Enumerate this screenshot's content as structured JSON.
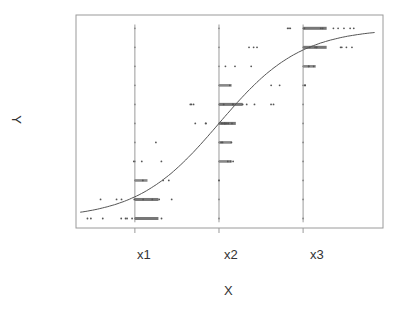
{
  "chart_data": {
    "type": "scatter",
    "title": "",
    "xlabel": "X",
    "ylabel": "Y",
    "x_tick_labels": [
      "x1",
      "x2",
      "x3"
    ],
    "x_tick_positions": [
      1,
      2,
      3
    ],
    "y_levels": [
      0,
      1,
      2,
      3,
      4,
      5,
      6,
      7,
      8,
      9,
      10
    ],
    "xlim": [
      0.3,
      3.95
    ],
    "ylim": [
      -0.5,
      10.7
    ],
    "grid": false,
    "legend": null,
    "vertical_reference_lines_at": [
      1,
      2,
      3
    ],
    "fitted_curve": {
      "shape": "logistic",
      "points": [
        [
          0.35,
          0.1
        ],
        [
          0.6,
          0.35
        ],
        [
          0.9,
          0.8
        ],
        [
          1.2,
          1.7
        ],
        [
          1.5,
          3.0
        ],
        [
          1.8,
          4.3
        ],
        [
          2.0,
          5.0
        ],
        [
          2.2,
          5.9
        ],
        [
          2.5,
          7.2
        ],
        [
          2.8,
          8.3
        ],
        [
          3.0,
          8.9
        ],
        [
          3.3,
          9.4
        ],
        [
          3.6,
          9.7
        ],
        [
          3.85,
          9.85
        ]
      ]
    },
    "series": [
      {
        "name": "observations",
        "clusters": [
          {
            "x": 1,
            "y": 0,
            "count": "many",
            "spread": [
              0.35,
              1.45
            ]
          },
          {
            "x": 1,
            "y": 1,
            "count": "many",
            "spread": [
              0.5,
              1.7
            ]
          },
          {
            "x": 1,
            "y": 2,
            "count": "several",
            "spread": [
              1.0,
              1.6
            ]
          },
          {
            "x": 1,
            "y": 3,
            "count": "few",
            "spread": [
              0.95,
              1.7
            ]
          },
          {
            "x": 1,
            "y": 4,
            "count": "few",
            "spread": [
              1.25,
              1.25
            ]
          },
          {
            "x": 1,
            "y": 5,
            "count": "few",
            "spread": [
              1.7,
              1.85
            ]
          },
          {
            "x": 1,
            "y": 6,
            "count": "few",
            "spread": [
              1.65,
              1.7
            ]
          },
          {
            "x": 2,
            "y": 2,
            "count": "few",
            "spread": [
              2.0,
              2.0
            ]
          },
          {
            "x": 2,
            "y": 3,
            "count": "several",
            "spread": [
              2.0,
              2.25
            ]
          },
          {
            "x": 2,
            "y": 4,
            "count": "several",
            "spread": [
              2.0,
              2.15
            ]
          },
          {
            "x": 2,
            "y": 5,
            "count": "many",
            "spread": [
              2.0,
              2.2
            ]
          },
          {
            "x": 2,
            "y": 6,
            "count": "many",
            "spread": [
              2.0,
              2.7
            ]
          },
          {
            "x": 2,
            "y": 7,
            "count": "several",
            "spread": [
              2.0,
              2.95
            ]
          },
          {
            "x": 2,
            "y": 8,
            "count": "few",
            "spread": [
              2.0,
              2.85
            ]
          },
          {
            "x": 2,
            "y": 9,
            "count": "few",
            "spread": [
              2.35,
              2.5
            ]
          },
          {
            "x": 2,
            "y": 10,
            "count": "few",
            "spread": [
              2.8,
              2.85
            ]
          },
          {
            "x": 3,
            "y": 7,
            "count": "few",
            "spread": [
              3.0,
              3.05
            ]
          },
          {
            "x": 3,
            "y": 8,
            "count": "several",
            "spread": [
              3.0,
              3.15
            ]
          },
          {
            "x": 3,
            "y": 9,
            "count": "many",
            "spread": [
              3.0,
              3.6
            ]
          },
          {
            "x": 3,
            "y": 10,
            "count": "many",
            "spread": [
              3.0,
              3.65
            ]
          }
        ]
      }
    ]
  },
  "colors": {
    "frame": "#9a9a9a",
    "points": "#555555",
    "curve": "#555555",
    "text": "#333333"
  }
}
